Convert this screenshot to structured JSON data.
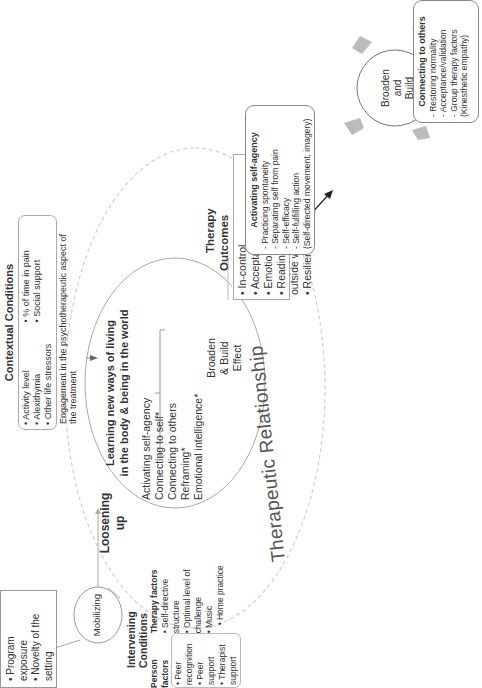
{
  "therapy_outcomes": {
    "title_line1": "Therapy",
    "title_line2": "Outcomes",
    "items": [
      "In-control",
      "Acceptance*",
      "Emotional Health*",
      "Readiness to engage with outside world",
      "Resilience*"
    ]
  },
  "contextual_conditions": {
    "title": "Contextual Conditions",
    "col1": [
      "Activity level",
      "Alexithymia",
      "Other life stressors"
    ],
    "col2": [
      "% of time in pain",
      "Social support"
    ],
    "wide": "Engagement in the psychotherapeutic aspect of the treatment"
  },
  "learning": {
    "title_line1": "Learning new ways of living",
    "title_line2": "in the body & being in the world",
    "items": [
      "Activating self-agency",
      "Connecting to self*",
      "Connecting to others",
      "Reframing*",
      "Emotional intelligence*"
    ],
    "effect_line1": "Broaden",
    "effect_line2": "& Build",
    "effect_line3": "Effect"
  },
  "loosening": {
    "line1": "Loosening",
    "line2": "up"
  },
  "mobilizing": {
    "label": "Mobilizing"
  },
  "program_box": {
    "items": [
      "Program exposure",
      "Novelty of the setting"
    ]
  },
  "intervening_conditions": {
    "title": "Intervening Conditions",
    "person_title": "Person factors",
    "person_items": [
      "Peer recognition",
      "Peer support",
      "Therapist support"
    ],
    "therapy_title": "Therapy factors",
    "therapy_items": [
      "Self-directive structure",
      "Optimal level of  challenge",
      "Music",
      "Home practice"
    ]
  },
  "therapeutic_relationship": {
    "label": "Therapeutic Relationship"
  },
  "broaden_build": {
    "center_line1": "Broaden",
    "center_line2": "and",
    "center_line3": "Build",
    "boxes": {
      "self_agency": {
        "title": "Activating self-agency",
        "items": [
          "Practicing spontaneity",
          "Separating self from pain",
          "Self-efficacy",
          "Self-fulfilling action"
        ],
        "note": "(Self-directed movement, imagery)"
      },
      "connecting_others": {
        "title": "Connecting to others",
        "items": [
          "Restoring normality",
          "Acceptance/validation",
          "Group therapy factors"
        ],
        "note": "(Kinesthetic empathy)"
      },
      "emotional_intelligence": {
        "title": "Emotional intelligence",
        "items": [
          "Emotional management*",
          "Broaden-and-build effect"
        ],
        "note": "(Emotional awareness, positive emotions, self-expression)"
      },
      "reframing": {
        "title": "Reframing",
        "items": [
          "Articulation",
          "Reappraisal*",
          "Widening*"
        ],
        "note": "(Kinesthetic awareness, self-transformation)"
      },
      "connecting_self": {
        "title": "Connecting to self",
        "items": [
          "Self-awareness*",
          "Mind-body connection",
          "Autobiographic integration"
        ],
        "note": "(Authentic movement, imagery, narrative reflection)"
      }
    }
  },
  "colors": {
    "line": "#555555",
    "dashed": "#cccccc",
    "arrow_fill": "#bbbbbb"
  }
}
